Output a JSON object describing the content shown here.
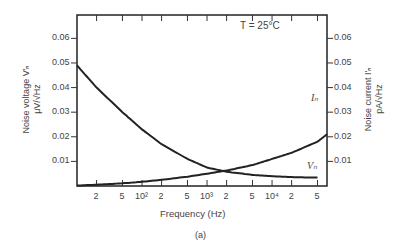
{
  "chart_data": {
    "type": "line",
    "title": "",
    "annotation": "T = 25°C",
    "caption": "(a)",
    "xlabel": "Frequency (Hz)",
    "xscale": "log",
    "xlim": [
      10,
      70000
    ],
    "x_tick_labels": [
      "2",
      "5",
      "10²",
      "2",
      "5",
      "10³",
      "2",
      "5",
      "10⁴",
      "2",
      "5"
    ],
    "ylabel_left": "Noise voltage V'n μV/√Hz",
    "ylabel_right": "Noise current I'n pA/√Hz",
    "ylim": [
      0,
      0.07
    ],
    "y_tick_labels": [
      "0.01",
      "0.02",
      "0.03",
      "0.04",
      "0.05",
      "0.06"
    ],
    "grid": false,
    "x": [
      10,
      20,
      50,
      100,
      200,
      500,
      1000,
      2000,
      5000,
      10000,
      20000,
      50000,
      70000
    ],
    "series": [
      {
        "name": "Vn",
        "label": "Vn",
        "values": [
          0.049,
          0.04,
          0.03,
          0.023,
          0.017,
          0.011,
          0.0075,
          0.0058,
          0.0045,
          0.004,
          0.0036,
          0.0034,
          0.0033
        ]
      },
      {
        "name": "In",
        "label": "In",
        "values": [
          0.0002,
          0.0005,
          0.0011,
          0.0017,
          0.0025,
          0.0038,
          0.005,
          0.0063,
          0.0085,
          0.011,
          0.0135,
          0.018,
          0.021
        ]
      }
    ]
  },
  "labels": {
    "annotation": "T = 25°C",
    "xlabel": "Frequency (Hz)",
    "caption": "(a)",
    "ylabel_left_1": "Noise voltage V'ₙ",
    "ylabel_left_2": "μV/√Hz",
    "ylabel_right_1": "Noise current I'ₙ",
    "ylabel_right_2": "pA/√Hz",
    "in_label": "Iₙ",
    "vn_label": "Vₙ"
  },
  "y_ticks": [
    "0.06",
    "0.05",
    "0.04",
    "0.03",
    "0.02",
    "0.01"
  ],
  "x_ticks": [
    "2",
    "5",
    "10²",
    "2",
    "5",
    "10³",
    "2",
    "5",
    "10⁴",
    "2",
    "5"
  ]
}
